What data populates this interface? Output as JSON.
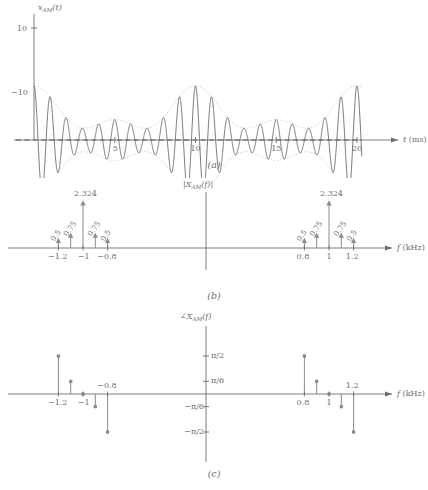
{
  "figure": {
    "axis_color": "#6e6e6e",
    "curve_color": "#5f5f5f",
    "envelope_color": "#b9b9b9",
    "stem_color": "#8a8a8a"
  },
  "panel_a": {
    "caption": "(a)",
    "ylabel_main": "x",
    "ylabel_sub": "AM",
    "ylabel_arg": "(t)",
    "xlabel_main": "t",
    "xlabel_unit": "(ms)",
    "yticks": [
      {
        "value": 10,
        "label": "10"
      },
      {
        "value": -10,
        "label": "−10"
      }
    ],
    "xticks": [
      {
        "value": 5,
        "label": "5"
      },
      {
        "value": 10,
        "label": "10"
      },
      {
        "value": 15,
        "label": "15"
      },
      {
        "value": 20,
        "label": "20"
      }
    ],
    "xlim": [
      0,
      21.2
    ],
    "ylim": [
      -12.5,
      12.5
    ],
    "zero_line": "dashed"
  },
  "panel_b": {
    "caption": "(b)",
    "ylabel_main": "|X",
    "ylabel_sub": "AM",
    "ylabel_arg": "(f)|",
    "xlabel_main": "f",
    "xlabel_unit": "(kHz)",
    "xticks": [
      {
        "value": -1.2,
        "label": "−1.2"
      },
      {
        "value": -1.0,
        "label": "−1"
      },
      {
        "value": -0.8,
        "label": "−0.8"
      },
      {
        "value": 0.8,
        "label": "0.8"
      },
      {
        "value": 1.0,
        "label": "1"
      },
      {
        "value": 1.2,
        "label": "1.2"
      }
    ],
    "stem_labels": [
      "0.5",
      "0.75",
      "2.324",
      "0.75",
      "0.5",
      "0.5",
      "0.75",
      "2.324",
      "0.75",
      "0.5"
    ]
  },
  "panel_c": {
    "caption": "(c)",
    "ylabel_main": "∠X",
    "ylabel_sub": "AM",
    "ylabel_arg": "(f)",
    "xlabel_main": "f",
    "xlabel_unit": "(kHz)",
    "yticks": [
      {
        "value": 1.5708,
        "label": "π/2"
      },
      {
        "value": 0.5236,
        "label": "π/6"
      },
      {
        "value": -0.5236,
        "label": "−π/6"
      },
      {
        "value": -1.5708,
        "label": "−π/2"
      }
    ],
    "xticks": [
      {
        "value": -1.2,
        "label": "−1.2",
        "pos": "below"
      },
      {
        "value": -1.0,
        "label": "−1",
        "pos": "below"
      },
      {
        "value": -0.8,
        "label": "−0.8",
        "pos": "above"
      },
      {
        "value": 0.8,
        "label": "0.8",
        "pos": "below"
      },
      {
        "value": 1.0,
        "label": "1",
        "pos": "below"
      },
      {
        "value": 1.2,
        "label": "1.2",
        "pos": "above"
      }
    ]
  },
  "chart_data": [
    {
      "type": "line",
      "panel": "a",
      "title": "x_AM(t)",
      "xlabel": "t (ms)",
      "ylabel": "x_AM(t)",
      "xlim": [
        0,
        21.2
      ],
      "ylim": [
        -12.5,
        12.5
      ],
      "grid": false,
      "legend": "none",
      "xtick_values": [
        5,
        10,
        15,
        20
      ],
      "ytick_values": [
        -10,
        10
      ],
      "description": "Amplitude-modulated carrier at 1 kHz with message tones at 100 Hz and 200 Hz; dotted beating envelope shown above and below, dashed zero line.",
      "series": [
        {
          "name": "x_AM(t)",
          "style": "solid",
          "model": "(2.324 + 1.5*cos(2*pi*0.1*t) + 1.0*cos(2*pi*0.2*t)) * cos(2*pi*1.0*t)",
          "carrier_khz": 1.0,
          "message_khz": [
            0.1,
            0.2
          ],
          "peak": 10
        },
        {
          "name": "envelope-upper",
          "style": "dotted",
          "model": "+(2.324 + 1.5*cos(2*pi*0.1*t) + 1.0*cos(2*pi*0.2*t))"
        },
        {
          "name": "envelope-lower",
          "style": "dotted",
          "model": "-(2.324 + 1.5*cos(2*pi*0.1*t) + 1.0*cos(2*pi*0.2*t))"
        },
        {
          "name": "zero-line",
          "style": "dashed",
          "values": [
            0,
            0
          ]
        }
      ]
    },
    {
      "type": "stem",
      "panel": "b",
      "title": "|X_AM(f)|",
      "xlabel": "f (kHz)",
      "ylabel": "|X_AM(f)|",
      "grid": false,
      "legend": "none",
      "xtick_values": [
        -1.2,
        -1.0,
        -0.8,
        0.8,
        1.0,
        1.2
      ],
      "x": [
        -1.2,
        -1.1,
        -1.0,
        -0.9,
        -0.8,
        0.8,
        0.9,
        1.0,
        1.1,
        1.2
      ],
      "values": [
        0.5,
        0.75,
        2.324,
        0.75,
        0.5,
        0.5,
        0.75,
        2.324,
        0.75,
        0.5
      ],
      "value_labels": [
        "0.5",
        "0.75",
        "2.324",
        "0.75",
        "0.5",
        "0.5",
        "0.75",
        "2.324",
        "0.75",
        "0.5"
      ]
    },
    {
      "type": "stem",
      "panel": "c",
      "title": "∠X_AM(f)",
      "xlabel": "f (kHz)",
      "ylabel": "∠X_AM(f)",
      "grid": false,
      "legend": "none",
      "ylim": [
        -1.8,
        1.8
      ],
      "ytick_values": [
        -1.5708,
        -0.5236,
        0.5236,
        1.5708
      ],
      "ytick_labels": [
        "−π/2",
        "−π/6",
        "π/6",
        "π/2"
      ],
      "xtick_values": [
        -1.2,
        -1.0,
        -0.8,
        0.8,
        1.0,
        1.2
      ],
      "x": [
        -1.2,
        -1.1,
        -1.0,
        -0.9,
        -0.8,
        0.8,
        0.9,
        1.0,
        1.1,
        1.2
      ],
      "values": [
        1.5708,
        0.5236,
        0.0,
        -0.5236,
        -1.5708,
        1.5708,
        0.5236,
        0.0,
        -0.5236,
        -1.5708
      ],
      "value_labels": [
        "π/2",
        "π/6",
        "0",
        "−π/6",
        "−π/2",
        "π/2",
        "π/6",
        "0",
        "−π/6",
        "−π/2"
      ]
    }
  ]
}
